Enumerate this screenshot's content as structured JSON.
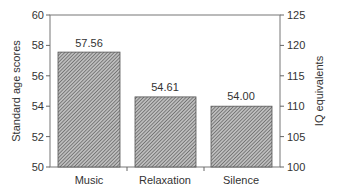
{
  "chart_data": {
    "type": "bar",
    "title": "",
    "categories": [
      "Music",
      "Relaxation",
      "Silence"
    ],
    "values": [
      57.56,
      54.61,
      54.0
    ],
    "value_labels": [
      "57.56",
      "54.61",
      "54.00"
    ],
    "xlabel": "",
    "ylabel": "Standard age scores",
    "ylim": [
      50,
      60
    ],
    "yticks": [
      "50",
      "52",
      "54",
      "56",
      "58",
      "60"
    ],
    "y2label": "IQ equivalents",
    "y2lim": [
      100,
      125
    ],
    "y2ticks": [
      "100",
      "105",
      "110",
      "115",
      "120",
      "125"
    ],
    "grid": false,
    "legend": null,
    "bar_fill": "diagonal-hatch",
    "colors": {
      "axis": "#666666",
      "bar_fill": "#8a8a8a",
      "bar_border": "#444444",
      "text": "#333333"
    }
  }
}
